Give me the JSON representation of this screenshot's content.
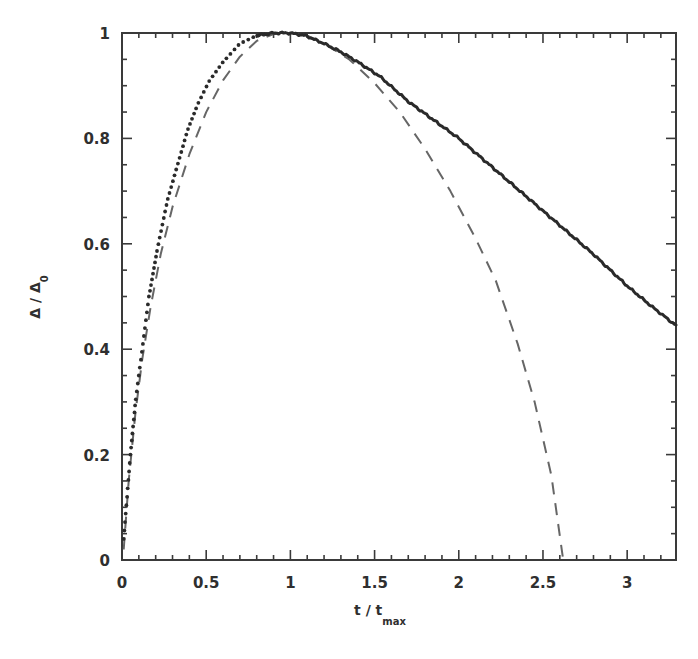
{
  "chart_data": {
    "type": "line",
    "title": "",
    "xlabel": "t / t",
    "xlabel_sub": "max",
    "ylabel": "Δ / Δ",
    "ylabel_sub": "0",
    "xlim": [
      0,
      3.29
    ],
    "ylim": [
      0,
      1
    ],
    "grid": false,
    "legend": null,
    "x_ticks": [
      0,
      0.5,
      1,
      1.5,
      2,
      2.5,
      3
    ],
    "x_tick_labels": [
      "0",
      "0.5",
      "1",
      "1.5",
      "2",
      "2.5",
      "3"
    ],
    "y_ticks": [
      0,
      0.2,
      0.4,
      0.6,
      0.8,
      1
    ],
    "y_tick_labels": [
      "0",
      "0.2",
      "0.4",
      "0.6",
      "0.8",
      "1"
    ],
    "series": [
      {
        "name": "measured",
        "style": "dots-solid",
        "color": "#2a2a2a",
        "x": [
          0.01,
          0.03,
          0.05,
          0.08,
          0.12,
          0.16,
          0.21,
          0.27,
          0.33,
          0.39,
          0.45,
          0.52,
          0.6,
          0.7,
          0.8,
          0.9,
          1.0,
          1.09,
          1.2,
          1.3,
          1.4,
          1.53,
          1.7,
          1.85,
          2.0,
          2.2,
          2.4,
          2.6,
          2.8,
          3.0,
          3.15,
          3.29
        ],
        "y": [
          0.04,
          0.12,
          0.2,
          0.3,
          0.4,
          0.5,
          0.59,
          0.683,
          0.75,
          0.816,
          0.865,
          0.91,
          0.945,
          0.98,
          0.995,
          1.0,
          1.0,
          0.995,
          0.98,
          0.964,
          0.945,
          0.918,
          0.87,
          0.835,
          0.8,
          0.745,
          0.69,
          0.635,
          0.58,
          0.52,
          0.48,
          0.445
        ]
      },
      {
        "name": "fit",
        "style": "dashed",
        "color": "#666666",
        "x": [
          0.01,
          0.04,
          0.08,
          0.12,
          0.17,
          0.23,
          0.3,
          0.4,
          0.5,
          0.6,
          0.7,
          0.8,
          0.9,
          1.0,
          1.1,
          1.2,
          1.35,
          1.5,
          1.65,
          1.8,
          1.95,
          2.1,
          2.22,
          2.35,
          2.45,
          2.55,
          2.62
        ],
        "y": [
          0.02,
          0.15,
          0.28,
          0.38,
          0.48,
          0.58,
          0.67,
          0.77,
          0.85,
          0.91,
          0.955,
          0.985,
          0.998,
          1.0,
          0.995,
          0.98,
          0.95,
          0.905,
          0.85,
          0.78,
          0.7,
          0.61,
          0.53,
          0.41,
          0.3,
          0.16,
          0.0
        ]
      }
    ]
  }
}
